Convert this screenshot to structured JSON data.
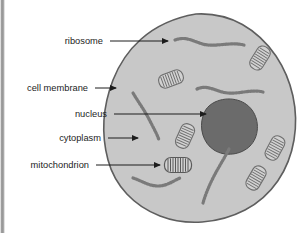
{
  "figure": {
    "background_color": "#ffffff"
  },
  "cell": {
    "name": "animal-cell",
    "fill_color": "#c8c8c8",
    "outline_color": "#5e5e5e"
  },
  "nucleus": {
    "name": "nucleus-shape",
    "fill_color": "#6b6b6b",
    "outline_color": "#4a4a4a"
  },
  "organelle_color": "#7a7a7a",
  "mitochondrion_fill": "#d2d2d2",
  "labels": [
    {
      "id": "ribosome",
      "text": "ribosome",
      "text_x": 103,
      "text_y": 44,
      "line_x1": 110,
      "line_x2": 168,
      "line_y": 41,
      "arrow_x": 172,
      "arrow_y": 41
    },
    {
      "id": "cell-membrane",
      "text": "cell membrane",
      "text_x": 88,
      "text_y": 91,
      "line_x1": 95,
      "line_x2": 116,
      "line_y": 88,
      "arrow_x": 120,
      "arrow_y": 88
    },
    {
      "id": "nucleus",
      "text": "nucleus",
      "text_x": 107,
      "text_y": 117,
      "line_x1": 114,
      "line_x2": 206,
      "line_y": 114,
      "arrow_x": 210,
      "arrow_y": 114
    },
    {
      "id": "cytoplasm",
      "text": "cytoplasm",
      "text_x": 101,
      "text_y": 141,
      "line_x1": 108,
      "line_x2": 138,
      "line_y": 138,
      "arrow_x": 142,
      "arrow_y": 138
    },
    {
      "id": "mitochondrion",
      "text": "mitochondrion",
      "text_x": 89,
      "text_y": 168,
      "line_x1": 96,
      "line_x2": 160,
      "line_y": 165,
      "arrow_x": 164,
      "arrow_y": 165
    }
  ],
  "ribosome_chains": [
    {
      "id": "ribosome-chain-top",
      "path": "M175,40 C188,35 196,44 208,45 C220,46 232,42 244,45"
    },
    {
      "id": "ribosome-chain-mid-right",
      "path": "M197,89 C208,84 216,92 228,93 C240,94 252,89 263,92"
    },
    {
      "id": "ribosome-chain-left-curve",
      "path": "M133,93 C139,103 145,111 150,121 C154,129 157,134 159,140"
    },
    {
      "id": "ribosome-chain-bottom-left",
      "path": "M133,178 C142,181 149,186 158,186 C167,186 173,181 180,178"
    },
    {
      "id": "ribosome-chain-bottom-right",
      "path": "M229,149 C224,159 218,168 213,178 C208,188 205,196 203,203"
    }
  ],
  "mitochondria": [
    {
      "id": "mitochondrion-upper-left",
      "cx": 171,
      "cy": 79,
      "w": 25,
      "h": 14,
      "rotate": -20
    },
    {
      "id": "mitochondrion-upper-right",
      "cx": 260,
      "cy": 58,
      "w": 25,
      "h": 14,
      "rotate": -58
    },
    {
      "id": "mitochondrion-center",
      "cx": 185,
      "cy": 136,
      "w": 25,
      "h": 14,
      "rotate": -66
    },
    {
      "id": "mitochondrion-labeled",
      "cx": 178,
      "cy": 165,
      "w": 27,
      "h": 15,
      "rotate": 0
    },
    {
      "id": "mitochondrion-lower-right-upper",
      "cx": 275,
      "cy": 148,
      "w": 25,
      "h": 14,
      "rotate": -62
    },
    {
      "id": "mitochondrion-lower-right-lower",
      "cx": 256,
      "cy": 178,
      "w": 25,
      "h": 14,
      "rotate": -60
    }
  ]
}
